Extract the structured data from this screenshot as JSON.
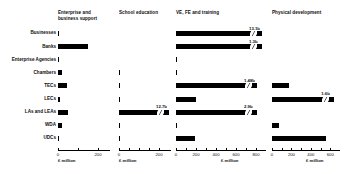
{
  "chart_data": {
    "type": "bar",
    "orientation": "horizontal",
    "title": "",
    "categories": [
      "Businesses",
      "Banks",
      "Enterprise Agencies",
      "Chambers",
      "TECs",
      "LECs",
      "LAs and LEAs",
      "WDA",
      "UDCs"
    ],
    "panels": [
      {
        "name": "enterprise-and-business-support",
        "title": "Enterprise and\nbusiness support",
        "xlabel": "£ million",
        "xlim": [
          0,
          260
        ],
        "ticks": [
          0,
          200
        ],
        "tick_labels": [
          "0",
          "200"
        ],
        "minor_ticks": [
          100
        ],
        "values": [
          3,
          150,
          6,
          22,
          46,
          8,
          50,
          20,
          5
        ],
        "value_labels": [
          "",
          "",
          "",
          "",
          "",
          "",
          "",
          "",
          ""
        ],
        "broken": [
          false,
          false,
          false,
          false,
          false,
          false,
          false,
          false,
          false
        ]
      },
      {
        "name": "school-education",
        "title": "School education",
        "xlabel": "£ million",
        "xlim": [
          0,
          260
        ],
        "ticks": [
          0,
          200
        ],
        "tick_labels": [
          "0",
          "200"
        ],
        "minor_ticks": [
          50,
          100,
          150
        ],
        "values": [
          0,
          0,
          0,
          4,
          4,
          5,
          250,
          4,
          4
        ],
        "value_labels": [
          "",
          "",
          "",
          "",
          "",
          "",
          "12.7b",
          "",
          ""
        ],
        "broken": [
          false,
          false,
          false,
          false,
          false,
          false,
          true,
          false,
          false
        ]
      },
      {
        "name": "ve-fe-and-training",
        "title": "VE, FE and training",
        "xlabel": "£ million",
        "xlim": [
          0,
          900
        ],
        "ticks": [
          0,
          200,
          400,
          600,
          800
        ],
        "tick_labels": [
          "0",
          "200",
          "400",
          "600",
          "800"
        ],
        "minor_ticks": [
          100,
          300,
          500,
          700
        ],
        "values": [
          860,
          860,
          8,
          12,
          810,
          200,
          810,
          8,
          190
        ],
        "value_labels": [
          "13.1b",
          "1.3b",
          "",
          "",
          "1.48b",
          "",
          "2.9b",
          "",
          ""
        ],
        "broken": [
          true,
          true,
          false,
          false,
          true,
          false,
          true,
          false,
          false
        ]
      },
      {
        "name": "physical-development",
        "title": "Physical development",
        "xlabel": "£ million",
        "xlim": [
          0,
          700
        ],
        "ticks": [
          0,
          200,
          400,
          600
        ],
        "tick_labels": [
          "0",
          "200",
          "400",
          "600"
        ],
        "minor_ticks": [
          100,
          300,
          500
        ],
        "values": [
          0,
          0,
          0,
          0,
          170,
          640,
          0,
          75,
          560
        ],
        "value_labels": [
          "",
          "",
          "",
          "",
          "",
          "1.6b",
          "",
          "",
          ""
        ],
        "broken": [
          false,
          false,
          false,
          false,
          false,
          true,
          false,
          false,
          false
        ]
      }
    ]
  }
}
